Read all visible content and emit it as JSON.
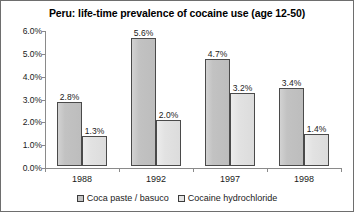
{
  "chart_data": {
    "type": "bar",
    "title": "Peru: life-time prevalence of cocaine use (age 12-50)",
    "xlabel": "",
    "ylabel": "",
    "ylim": [
      0,
      6
    ],
    "grid": false,
    "legend_position": "bottom",
    "categories": [
      "1988",
      "1992",
      "1997",
      "1998"
    ],
    "ytick_labels": [
      "0.0%",
      "1.0%",
      "2.0%",
      "3.0%",
      "4.0%",
      "5.0%",
      "6.0%"
    ],
    "ytick_values": [
      0,
      1,
      2,
      3,
      4,
      5,
      6
    ],
    "series": [
      {
        "name": "Coca paste / basuco",
        "color": "#c4c4c4",
        "values": [
          2.8,
          5.6,
          4.7,
          3.4
        ],
        "data_labels": [
          "2.8%",
          "5.6%",
          "4.7%",
          "3.4%"
        ]
      },
      {
        "name": "Cocaine hydrochloride",
        "color": "#e4e4e4",
        "values": [
          1.3,
          2.0,
          3.2,
          1.4
        ],
        "data_labels": [
          "1.3%",
          "2.0%",
          "3.2%",
          "1.4%"
        ]
      }
    ]
  }
}
